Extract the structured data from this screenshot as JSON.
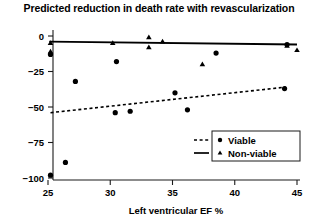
{
  "chart_data": {
    "type": "scatter",
    "title": "Predicted reduction in death rate with revascularization",
    "xlabel": "Left ventricular EF %",
    "ylabel": "",
    "xlim": [
      24,
      46
    ],
    "ylim": [
      -105,
      8
    ],
    "xticks": [
      25,
      30,
      35,
      40,
      45
    ],
    "yticks": [
      0,
      -25,
      -50,
      -75,
      -100
    ],
    "xticklabels": [
      "25",
      "30",
      "35",
      "40",
      "45"
    ],
    "yticklabels": [
      "0",
      "−25",
      "−50",
      "−75",
      "−100"
    ],
    "grid": false,
    "legend_position": "lower right",
    "series": [
      {
        "name": "Viable",
        "marker": "circle",
        "line_style": "dashed",
        "color": "#000000",
        "points": [
          {
            "x": 25.2,
            "y": -13
          },
          {
            "x": 25.2,
            "y": -98
          },
          {
            "x": 26.4,
            "y": -89
          },
          {
            "x": 27.2,
            "y": -32
          },
          {
            "x": 30.4,
            "y": -54
          },
          {
            "x": 30.5,
            "y": -18
          },
          {
            "x": 31.6,
            "y": -53
          },
          {
            "x": 35.2,
            "y": -40
          },
          {
            "x": 36.2,
            "y": -52
          },
          {
            "x": 38.5,
            "y": -12
          },
          {
            "x": 44.0,
            "y": -37
          },
          {
            "x": 44.2,
            "y": -6
          }
        ],
        "fit_line": {
          "x1": 25.2,
          "y1": -54,
          "x2": 44.1,
          "y2": -36
        }
      },
      {
        "name": "Non-viable",
        "marker": "triangle",
        "line_style": "solid",
        "color": "#000000",
        "points": [
          {
            "x": 25.2,
            "y": -5
          },
          {
            "x": 25.2,
            "y": -11
          },
          {
            "x": 30.2,
            "y": -5
          },
          {
            "x": 33.1,
            "y": -1
          },
          {
            "x": 33.1,
            "y": -8
          },
          {
            "x": 34.2,
            "y": -4
          },
          {
            "x": 37.4,
            "y": -20
          },
          {
            "x": 44.2,
            "y": -7
          },
          {
            "x": 45.0,
            "y": -10
          }
        ],
        "fit_line": {
          "x1": 25.1,
          "y1": -4,
          "x2": 45.0,
          "y2": -6
        }
      }
    ]
  },
  "legend": {
    "items": [
      {
        "label": "Viable",
        "marker": "circle",
        "line": "dashed"
      },
      {
        "label": "Non-viable",
        "marker": "triangle",
        "line": "solid"
      }
    ]
  }
}
